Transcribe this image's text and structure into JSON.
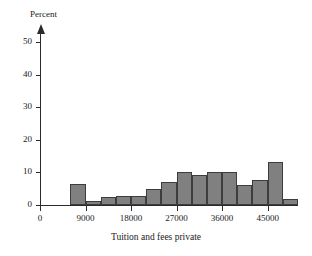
{
  "chart_data": {
    "type": "bar",
    "title": "",
    "subtitle": "",
    "xlabel": "Tuition and fees private",
    "ylabel": "Percent",
    "grid": false,
    "legend": null,
    "bin_width": 3000,
    "xlim": [
      0,
      51000
    ],
    "ylim": [
      0,
      55
    ],
    "xticks": [
      0,
      9000,
      18000,
      27000,
      36000,
      45000
    ],
    "xtick_labels": [
      "0",
      "9000",
      "18000",
      "27000",
      "36000",
      "45000"
    ],
    "yticks": [
      0,
      10,
      20,
      30,
      40,
      50
    ],
    "ytick_labels": [
      "0",
      "10",
      "20",
      "30",
      "40",
      "50"
    ],
    "bin_starts": [
      6000,
      9000,
      12000,
      15000,
      18000,
      21000,
      24000,
      27000,
      30000,
      33000,
      36000,
      39000,
      42000,
      45000,
      48000
    ],
    "categories": [
      "6000-9000",
      "9000-12000",
      "12000-15000",
      "15000-18000",
      "18000-21000",
      "21000-24000",
      "24000-27000",
      "27000-30000",
      "30000-33000",
      "33000-36000",
      "36000-39000",
      "39000-42000",
      "42000-45000",
      "45000-48000",
      "48000-51000"
    ],
    "values": [
      6.4,
      1.1,
      2.4,
      2.9,
      2.7,
      5.0,
      7.0,
      10.1,
      9.3,
      10.0,
      10.0,
      6.3,
      7.7,
      13.2,
      1.9
    ],
    "bar_color": "#808080",
    "bar_edge_color": "#3d3d3d",
    "axis_color": "#2b2b2b"
  }
}
